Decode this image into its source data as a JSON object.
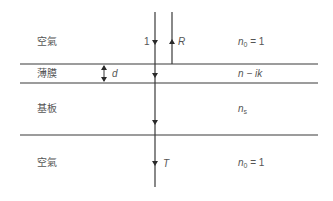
{
  "layers": [
    {
      "name": "空氣",
      "index_main": "n",
      "index_sub": "0",
      "index_rest": " = 1"
    },
    {
      "name": "薄膜",
      "index_main": "n − ik",
      "index_sub": "",
      "index_rest": ""
    },
    {
      "name": "基板",
      "index_main": "n",
      "index_sub": "s",
      "index_rest": ""
    },
    {
      "name": "空氣",
      "index_main": "n",
      "index_sub": "0",
      "index_rest": " = 1"
    }
  ],
  "beams": {
    "incident": "1",
    "reflected": "R",
    "transmitted": "T"
  },
  "thickness_label": "d",
  "colors": {
    "line": "#3a3a3a",
    "text": "#555555"
  }
}
